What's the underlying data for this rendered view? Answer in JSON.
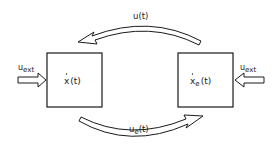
{
  "diagram": {
    "blocks": [
      {
        "id": "system",
        "state_label": "x",
        "state_sub": "",
        "arg": "(t)"
      },
      {
        "id": "environment",
        "state_label": "x",
        "state_sub": "e",
        "arg": "(t)"
      }
    ],
    "external_inputs": [
      {
        "target": "system",
        "label": "u",
        "sub": "ext"
      },
      {
        "target": "environment",
        "label": "u",
        "sub": "ext"
      }
    ],
    "couplings": [
      {
        "from": "environment",
        "to": "system",
        "label": "u",
        "sub": "",
        "arg": "(t)"
      },
      {
        "from": "system",
        "to": "environment",
        "label": "u",
        "sub": "e",
        "arg": "(t)"
      }
    ],
    "colors": {
      "stroke": "#1a1a1a",
      "background": "#ffffff"
    }
  }
}
